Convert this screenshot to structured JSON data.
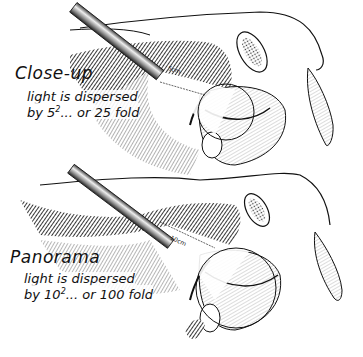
{
  "figure": {
    "topic": "laparoscope light dispersion by distance",
    "panels": [
      {
        "id": "close-up",
        "title": "Close-up",
        "line1": "light is dispersed",
        "line2_prefix": "by 5",
        "line2_exp": "2",
        "line2_suffix": "... or 25 fold",
        "distance_label": "5cm"
      },
      {
        "id": "panorama",
        "title": "Panorama",
        "line1": "light is dispersed",
        "line2_prefix": "by 10",
        "line2_exp": "2",
        "line2_suffix": "... or 100 fold",
        "distance_label": "10cm"
      }
    ],
    "colors": {
      "ink": "#111111",
      "hatch": "#555555",
      "background": "#ffffff"
    }
  }
}
